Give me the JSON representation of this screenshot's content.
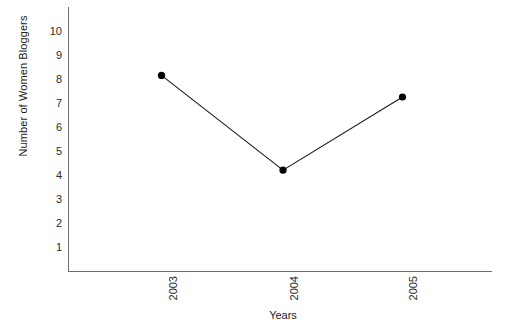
{
  "chart_data": {
    "type": "line",
    "title": "",
    "subtitle": "",
    "xlabel": "Years",
    "ylabel": "Number of Women Bloggers",
    "categories": [
      "2003",
      "2004",
      "2005"
    ],
    "values": [
      7.9,
      3.95,
      7.0
    ],
    "series": [
      {
        "name": "Number of Women Bloggers",
        "values": [
          7.9,
          3.95,
          7.0
        ]
      }
    ],
    "x_tick_labels": [
      "2003",
      "2004",
      "2005"
    ],
    "y_tick_labels": [
      "10",
      "9",
      "8",
      "7",
      "6",
      "5",
      "4",
      "3",
      "2",
      "1"
    ],
    "y_tick_values": [
      10,
      9,
      8,
      7,
      6,
      5,
      4,
      3,
      2,
      1
    ],
    "ylim": [
      0,
      10.6
    ],
    "xlim": [
      0,
      4
    ],
    "grid": false,
    "legend": false,
    "legend_position": "none",
    "marker": "filled-circle",
    "line_color": "#1a1a1a",
    "marker_color": "#000000",
    "axis_color": "#6e6e6e",
    "background_color": "#ffffff",
    "annotations": []
  }
}
